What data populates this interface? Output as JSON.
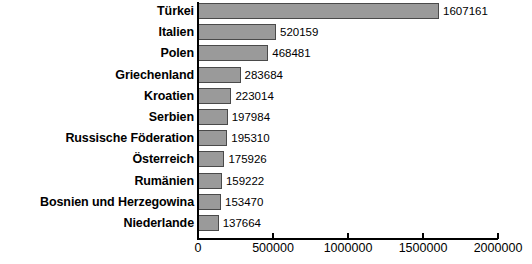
{
  "chart_data": {
    "type": "bar",
    "orientation": "horizontal",
    "title": "",
    "subtitle": "",
    "xlabel": "",
    "ylabel": "",
    "grid": false,
    "legend": false,
    "xlim": [
      0,
      2000000
    ],
    "xticks": [
      0,
      500000,
      1000000,
      1500000,
      2000000
    ],
    "xticklabels": [
      "0",
      "500000",
      "1000000",
      "1500000",
      "2000000"
    ],
    "categories": [
      "Türkei",
      "Italien",
      "Polen",
      "Griechenland",
      "Kroatien",
      "Serbien",
      "Russische Föderation",
      "Österreich",
      "Rumänien",
      "Bosnien und Herzegowina",
      "Niederlande"
    ],
    "values": [
      1607161,
      520159,
      468481,
      283684,
      223014,
      197984,
      195310,
      175926,
      159222,
      153470,
      137664
    ],
    "value_labels": [
      "1607161",
      "520159",
      "468481",
      "283684",
      "223014",
      "197984",
      "195310",
      "175926",
      "159222",
      "153470",
      "137664"
    ],
    "bar_color": "#9a9a9a",
    "bar_border_color": "#4a4a4a",
    "axis_color": "#000000",
    "background_color": "#ffffff"
  }
}
